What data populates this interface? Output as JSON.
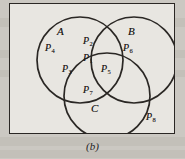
{
  "figure": {
    "caption": "(b)",
    "type": "venn-diagram-3-set",
    "sets": [
      {
        "id": "A",
        "label": "A",
        "cx": 80,
        "cy": 60,
        "r": 46
      },
      {
        "id": "B",
        "label": "B",
        "cx": 134,
        "cy": 60,
        "r": 46
      },
      {
        "id": "C",
        "label": "C",
        "cx": 107,
        "cy": 97,
        "r": 46
      }
    ],
    "set_labels": [
      {
        "name": "set-label-a",
        "text": "A",
        "x": 57,
        "y": 30
      },
      {
        "name": "set-label-b",
        "text": "B",
        "x": 128,
        "y": 30
      },
      {
        "name": "set-label-c",
        "text": "C",
        "x": 91,
        "y": 107
      }
    ],
    "regions": [
      {
        "name": "region-p1",
        "symbol": "P",
        "subscript": "1",
        "meaning": "A ∩ B ∩ C",
        "x": 86,
        "y": 58
      },
      {
        "name": "region-p2",
        "symbol": "P",
        "subscript": "2",
        "meaning": "A ∩ B only",
        "x": 86,
        "y": 41
      },
      {
        "name": "region-p3",
        "symbol": "P",
        "subscript": "3",
        "meaning": "A ∩ C only",
        "x": 66,
        "y": 69
      },
      {
        "name": "region-p4",
        "symbol": "P",
        "subscript": "4",
        "meaning": "A only",
        "x": 49,
        "y": 47
      },
      {
        "name": "region-p5",
        "symbol": "P",
        "subscript": "5",
        "meaning": "B ∩ C only",
        "x": 104,
        "y": 69
      },
      {
        "name": "region-p6",
        "symbol": "P",
        "subscript": "6",
        "meaning": "B only",
        "x": 126,
        "y": 47
      },
      {
        "name": "region-p7",
        "symbol": "P",
        "subscript": "7",
        "meaning": "C only",
        "x": 86,
        "y": 89
      },
      {
        "name": "region-p8",
        "symbol": "P",
        "subscript": "8",
        "meaning": "outside all sets",
        "x": 149,
        "y": 116
      }
    ]
  },
  "style": {
    "ink": "#1d1a18",
    "stroke": "#2a2724",
    "paper": "#e8e6e1",
    "page_background": "#cbc8c2"
  }
}
